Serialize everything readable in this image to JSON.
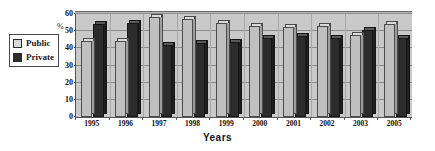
{
  "chart_data": {
    "type": "bar",
    "title": "",
    "xlabel": "Years",
    "ylabel": "%",
    "ylim": [
      0,
      60
    ],
    "yticks": [
      0,
      10,
      20,
      30,
      40,
      50,
      60
    ],
    "grid": true,
    "legend_position": "left-outside",
    "categories": [
      "1995",
      "1996",
      "1997",
      "1998",
      "1999",
      "2000",
      "2001",
      "2002",
      "2003",
      "2005"
    ],
    "series": [
      {
        "name": "Public",
        "color": "#c0c0c0",
        "values": [
          44.5,
          44,
          58,
          57,
          55,
          53,
          52.5,
          53,
          48,
          54
        ]
      },
      {
        "name": "Private",
        "color": "#2c2c2c",
        "values": [
          54,
          54.5,
          42,
          43,
          43.5,
          46,
          47,
          46,
          50.5,
          46
        ]
      }
    ]
  },
  "legend": {
    "items": [
      {
        "label": "Public"
      },
      {
        "label": "Private"
      }
    ]
  },
  "axes": {
    "y_unit_label": "%",
    "x_title": "Years"
  },
  "colors": {
    "public": "#c0c0c0",
    "private": "#2c2c2c",
    "plot_background": "#c9c9c9",
    "gridline": "#8d8d8d",
    "page_background": "#ffffff"
  }
}
